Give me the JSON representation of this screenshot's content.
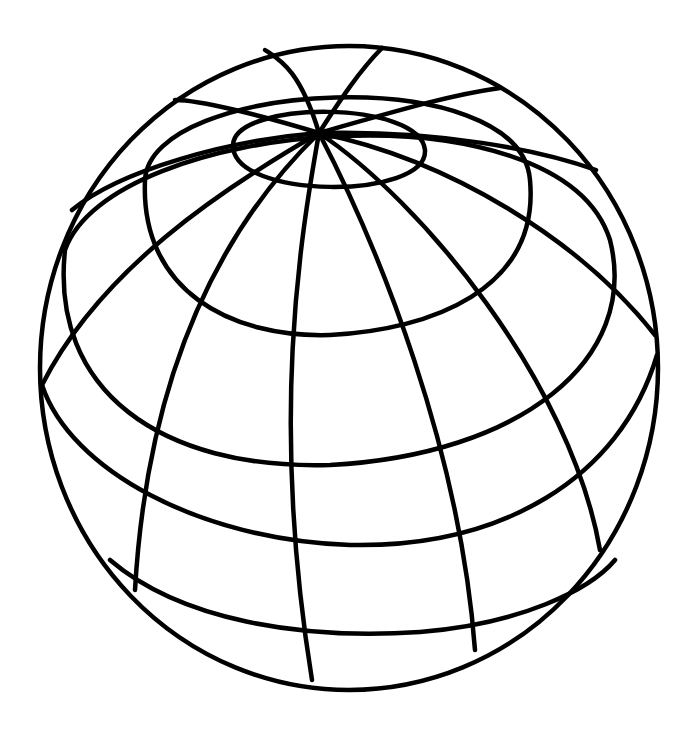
{
  "illustration": {
    "subject": "wireframe globe",
    "stroke_color": "#000000",
    "background_color": "#ffffff",
    "outline": {
      "cx": 349,
      "cy": 368,
      "rx": 309,
      "ry": 322
    },
    "pole": {
      "x": 319,
      "y": 133
    },
    "latitude_rings": [
      "M 233 145 C 235 100, 420 100, 425 150 C 428 200, 232 200, 233 145 Z",
      "M 145 180 C 150 80, 520 60, 530 180 C 540 290, 430 330, 330 335 C 230 338, 140 290, 145 180 Z",
      "M 65 250 C 110 120, 560 80, 610 240 C 640 360, 520 455, 330 465 C 160 470, 50 390, 65 250 Z",
      "M 42 385 C 70 470, 200 540, 350 545 C 500 548, 620 480, 657 355",
      "M 110 560 C 180 620, 300 640, 420 632 C 520 624, 590 590, 615 560"
    ],
    "meridians": [
      "M 319 133 C 300 70, 280 60, 265 50",
      "M 319 133 C 340 100, 360 70, 382 48",
      "M 319 133 C 400 110, 450 95, 500 88",
      "M 319 133 C 440 130, 540 150, 596 170",
      "M 319 133 C 450 160, 580 240, 655 335",
      "M 319 133 C 420 200, 570 380, 600 550",
      "M 319 133 C 380 250, 460 450, 475 650",
      "M 319 133 C 300 240, 270 420, 312 680",
      "M 319 133 C 250 200, 150 330, 135 590",
      "M 319 133 C 220 190, 100 270, 42 385",
      "M 319 133 C 230 140, 120 170, 72 210",
      "M 319 133 C 260 115, 200 100, 175 100"
    ]
  }
}
